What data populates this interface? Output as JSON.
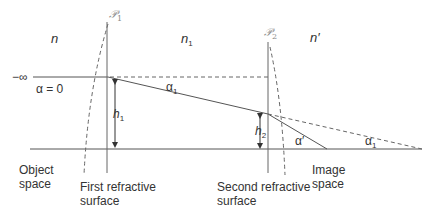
{
  "diagram": {
    "colors": {
      "line": "#555555",
      "dashed": "#666666",
      "text": "#333333",
      "script_label": "#888888"
    },
    "media_labels": {
      "object_index": "n",
      "middle_index": "n",
      "middle_index_sub": "1",
      "image_index": "n′"
    },
    "surface_labels": {
      "surface1_symbol": "𝒫",
      "surface1_sub": "1",
      "surface2_symbol": "𝒫",
      "surface2_sub": "2"
    },
    "ray_labels": {
      "infinity": "−∞",
      "alpha_zero": "α = 0",
      "alpha1_top": "α",
      "alpha1_top_sub": "1",
      "alpha_prime": "α′",
      "alpha1_bottom": "α",
      "alpha1_bottom_sub": "1"
    },
    "heights": {
      "h1": "h",
      "h1_sub": "1",
      "h2": "h",
      "h2_sub": "2"
    },
    "space_labels": {
      "object_space_line1": "Object",
      "object_space_line2": "space",
      "first_surface_line1": "First refractive",
      "first_surface_line2": "surface",
      "second_surface_line1": "Second refractive",
      "second_surface_line2": "surface",
      "image_space_line1": "Image",
      "image_space_line2": "space"
    }
  }
}
